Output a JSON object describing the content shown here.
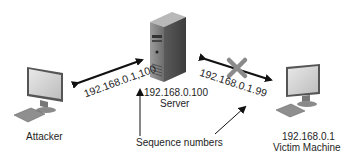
{
  "nodes": {
    "attacker": {
      "label": "Attacker"
    },
    "server": {
      "ip": "192.168.0.100",
      "label": "Server"
    },
    "victim": {
      "ip": "192.168.0.1",
      "label": "Victim Machine"
    }
  },
  "links": {
    "attacker_server": {
      "label": "192.168.0.1,100"
    },
    "server_victim": {
      "label": "192.168.0.1.99",
      "blocked": true
    }
  },
  "annotation": {
    "label": "Sequence numbers"
  },
  "colors": {
    "arrow": "#111111",
    "cross": "#8a8a8a",
    "text": "#1e1e1e"
  }
}
